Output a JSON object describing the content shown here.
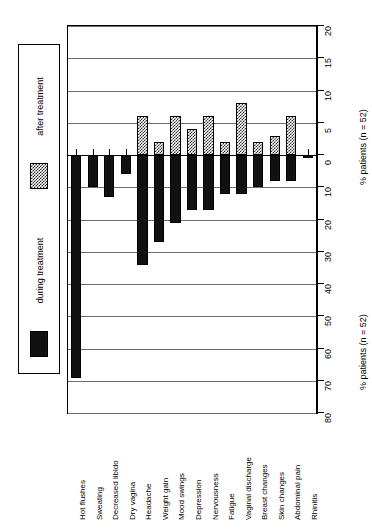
{
  "legend": {
    "entries": [
      {
        "key": "after",
        "label": "after treatment",
        "swatch": "hatched-swatch"
      },
      {
        "key": "during",
        "label": "during treatment",
        "swatch": "solid-black-swatch"
      }
    ]
  },
  "axis": {
    "upper_title": "% patients (n = 52)",
    "lower_title": "% patients (n = 52)",
    "upper_ticks": [
      20,
      15,
      10,
      5,
      0
    ],
    "lower_ticks": [
      0,
      10,
      20,
      30,
      40,
      50,
      60,
      70,
      80
    ]
  },
  "colors": {
    "after_treatment": "#303030",
    "during_treatment": "#111111",
    "gridline": "#6f6f6f",
    "frame": "#000000",
    "background": "#ffffff"
  },
  "chart_data": {
    "type": "bar",
    "title": "",
    "subtitle": "",
    "orientation": "vertical-bidirectional",
    "xlabel": "",
    "ylabel": "% patients (n = 52)",
    "grid": true,
    "legend_position": "left",
    "note": "Upper half (positive, hatched) = after treatment, scale 0 to 20. Lower half (negative, solid black) = during treatment, scale 0 to 80 shown as descending magnitude.",
    "ylim_upper": [
      0,
      20
    ],
    "ylim_lower": [
      0,
      80
    ],
    "categories": [
      "Hot flushes",
      "Sweating",
      "Decreased libido",
      "Dry vagina",
      "Headache",
      "Weight gain",
      "Mood swings",
      "Depression",
      "Nervousness",
      "Fatigue",
      "Vaginal discharge",
      "Breast changes",
      "Skin changes",
      "Abdominal pain",
      "Rhinitis"
    ],
    "series": [
      {
        "name": "after treatment",
        "direction": "up",
        "scale_max": 20,
        "values": [
          0,
          0,
          0,
          0,
          6,
          2,
          6,
          4,
          6,
          2,
          8,
          2,
          3,
          6,
          0
        ]
      },
      {
        "name": "during treatment",
        "direction": "down",
        "scale_max": 80,
        "values": [
          69,
          10,
          13,
          6,
          34,
          27,
          21,
          17,
          17,
          12,
          12,
          10,
          8,
          8,
          1
        ]
      }
    ]
  }
}
